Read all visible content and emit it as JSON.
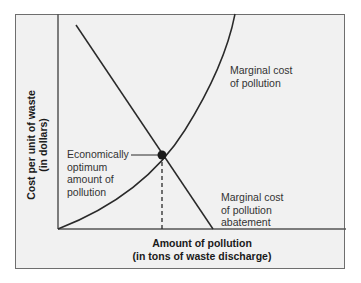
{
  "diagram": {
    "y_axis": {
      "line1": "Cost per unit of waste",
      "line2": "(in dollars)"
    },
    "x_axis": {
      "line1": "Amount of pollution",
      "line2": "(in tons of waste discharge)"
    },
    "curves": [
      {
        "name": "Marginal cost of pollution",
        "label_line1": "Marginal cost",
        "label_line2": "of pollution",
        "shape": "upward convex curve"
      },
      {
        "name": "Marginal cost of pollution abatement",
        "label_line1": "Marginal cost",
        "label_line2": "of pollution",
        "label_line3": "abatement",
        "shape": "downward straight line"
      }
    ],
    "optimum": {
      "line1": "Economically",
      "line2": "optimum",
      "line3": "amount of",
      "line4": "pollution"
    },
    "colors": {
      "background": "#f1f1f1",
      "frame": "#6e6e6e",
      "curve": "#2a2a2a",
      "point": "#1a1a1a"
    }
  }
}
